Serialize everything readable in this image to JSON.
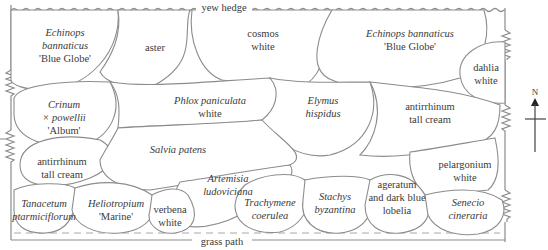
{
  "diagram": {
    "type": "planting-plan",
    "boundaries": {
      "north": "yew hedge",
      "south": "grass path"
    },
    "compass": {
      "label": "N"
    },
    "colors": {
      "outline": "#8c8c8c",
      "text": "#3a3a3a",
      "background": "#ffffff"
    },
    "plants": [
      {
        "id": "echinops-1",
        "lines": [
          "Echinops",
          "bannaticus",
          "'Blue Globe'"
        ],
        "italic": [
          true,
          true,
          false
        ]
      },
      {
        "id": "aster",
        "lines": [
          "aster"
        ],
        "italic": [
          false
        ]
      },
      {
        "id": "cosmos",
        "lines": [
          "cosmos",
          "white"
        ],
        "italic": [
          false,
          false
        ]
      },
      {
        "id": "echinops-2",
        "lines": [
          "Echinops bannaticus",
          "'Blue Globe'"
        ],
        "italic": [
          true,
          false
        ]
      },
      {
        "id": "dahlia",
        "lines": [
          "dahlia",
          "white"
        ],
        "italic": [
          false,
          false
        ]
      },
      {
        "id": "crinum",
        "lines": [
          "Crinum",
          "× powellii",
          "'Album'"
        ],
        "italic": [
          true,
          true,
          false
        ]
      },
      {
        "id": "phlox",
        "lines": [
          "Phlox paniculata",
          "white"
        ],
        "italic": [
          true,
          false
        ]
      },
      {
        "id": "elymus",
        "lines": [
          "Elymus",
          "hispidus"
        ],
        "italic": [
          true,
          true
        ]
      },
      {
        "id": "antirrhinum-right",
        "lines": [
          "antirrhinum",
          "tall cream"
        ],
        "italic": [
          false,
          false
        ]
      },
      {
        "id": "antirrhinum-left",
        "lines": [
          "antirrhinum",
          "tall cream"
        ],
        "italic": [
          false,
          false
        ]
      },
      {
        "id": "salvia",
        "lines": [
          "Salvia patens"
        ],
        "italic": [
          true
        ]
      },
      {
        "id": "artemisia",
        "lines": [
          "Artemisia",
          "ludoviciana"
        ],
        "italic": [
          true,
          true
        ]
      },
      {
        "id": "pelargonium",
        "lines": [
          "pelargonium",
          "white"
        ],
        "italic": [
          false,
          false
        ]
      },
      {
        "id": "tanacetum",
        "lines": [
          "Tanacetum",
          "ptarmiciflorum"
        ],
        "italic": [
          true,
          true
        ]
      },
      {
        "id": "heliotropium",
        "lines": [
          "Heliotropium",
          "'Marine'"
        ],
        "italic": [
          true,
          false
        ]
      },
      {
        "id": "verbena",
        "lines": [
          "verbena",
          "white"
        ],
        "italic": [
          false,
          false
        ]
      },
      {
        "id": "trachymene",
        "lines": [
          "Trachymene",
          "coerulea"
        ],
        "italic": [
          true,
          true
        ]
      },
      {
        "id": "stachys",
        "lines": [
          "Stachys",
          "byzantina"
        ],
        "italic": [
          true,
          true
        ]
      },
      {
        "id": "ageratum",
        "lines": [
          "ageratum",
          "and dark blue",
          "lobelia"
        ],
        "italic": [
          false,
          false,
          false
        ]
      },
      {
        "id": "senecio",
        "lines": [
          "Senecio",
          "cineraria"
        ],
        "italic": [
          true,
          true
        ]
      }
    ]
  }
}
